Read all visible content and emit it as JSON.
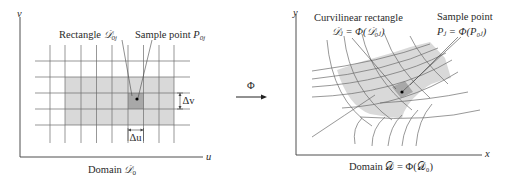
{
  "left_panel": {
    "axis_labels": {
      "vertical": "v",
      "horizontal": "u"
    },
    "callouts": {
      "rectangle_label": "Rectangle ",
      "rectangle_symbol": "𝒟",
      "rectangle_sub": "0j",
      "sample_label": "Sample point ",
      "sample_symbol": "P",
      "sample_sub": "0j"
    },
    "increments": {
      "dv": "Δv",
      "du": "Δu"
    },
    "caption_text": "Domain ",
    "caption_symbol": "𝒟",
    "caption_sub": "0"
  },
  "mapping": {
    "symbol": "Φ"
  },
  "right_panel": {
    "axis_labels": {
      "vertical": "y",
      "horizontal": "x"
    },
    "callouts": {
      "curvilinear_title": "Curvilinear rectangle",
      "curvilinear_formula": "𝒟ⱼ = Φ(𝒟₀ⱼ)",
      "sample_title": "Sample point",
      "sample_formula": "Pⱼ = Φ(P₀ⱼ)"
    },
    "caption": "Domain 𝒟 = Φ(𝒟₀)"
  },
  "colors": {
    "shade_light": "#d9d9d9",
    "shade_dark": "#a8a8a8",
    "lines": "#6b6b6b",
    "text": "#2a2a2a"
  }
}
